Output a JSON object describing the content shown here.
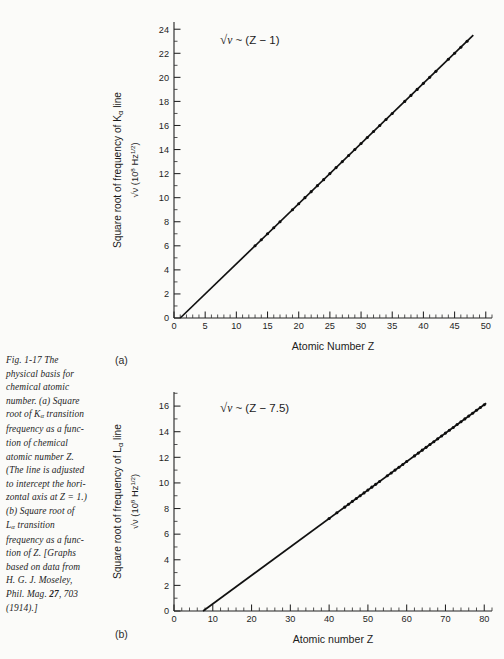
{
  "figure": {
    "caption_lines": [
      "Fig. 1-17   The",
      "physical basis for",
      "chemical atomic",
      "number.   (a) Square",
      "root of Kα transition",
      "frequency as a func-",
      "tion of chemical",
      "atomic number Z.",
      "(The line is adjusted",
      "to intercept the hori-",
      "zontal axis at  Z = 1.)",
      "(b)  Square root of",
      "Lα transition",
      "frequency as a func-",
      "tion of Z.  [Graphs",
      "based on data from",
      "H. G. J. Moseley,",
      "Phil. Mag. 27, 703",
      "(1914).]"
    ],
    "panel_label_a": "(a)",
    "panel_label_b": "(b)"
  },
  "chart_data": [
    {
      "type": "scatter",
      "panel": "(a)",
      "title": "",
      "annotation": "√ν ~ (Z − 1)",
      "xlabel": "Atomic Number Z",
      "ylabel": "Square root of frequency of Kα line  √ν (10⁸ Hz¹ᐟ²)",
      "ylabel_line1": "Square root of frequency of K",
      "ylabel_line1_sub": "α",
      "ylabel_line1_tail": " line",
      "ylabel_line2": "√ν (10⁸ Hz",
      "ylabel_line2_sup": "1/2",
      "ylabel_line2_tail": ")",
      "xlim": [
        0,
        51
      ],
      "ylim": [
        0,
        24.6
      ],
      "xticks": [
        0,
        5,
        10,
        15,
        20,
        25,
        30,
        35,
        40,
        45,
        50
      ],
      "yticks": [
        0,
        2,
        4,
        6,
        8,
        10,
        12,
        14,
        16,
        18,
        20,
        22,
        24
      ],
      "x_minor_step": 1,
      "y_minor_step": 1,
      "grid": false,
      "fit": {
        "intercept_z": 1,
        "slope": 0.5
      },
      "x": [
        13,
        14,
        15,
        16,
        17,
        19,
        20,
        21,
        22,
        23,
        24,
        25,
        26,
        27,
        28,
        29,
        30,
        31,
        32,
        33,
        34,
        35,
        37,
        38,
        39,
        40,
        41,
        42,
        44,
        45,
        46,
        47
      ],
      "y": [
        6.0,
        6.5,
        7.0,
        7.5,
        8.0,
        9.0,
        9.5,
        10.0,
        10.5,
        11.0,
        11.5,
        12.0,
        12.5,
        13.0,
        13.5,
        14.0,
        14.5,
        15.0,
        15.5,
        16.0,
        16.5,
        17.0,
        18.0,
        18.5,
        19.0,
        19.5,
        20.0,
        20.5,
        21.5,
        22.0,
        22.5,
        23.0
      ],
      "line_x": [
        1,
        48
      ],
      "line_y": [
        0,
        23.5
      ]
    },
    {
      "type": "scatter",
      "panel": "(b)",
      "title": "",
      "annotation": "√ν ~ (Z − 7.5)",
      "xlabel": "Atomic number Z",
      "ylabel": "Square root of frequency of Lα line  √ν (10⁸ Hz¹ᐟ²)",
      "ylabel_line1": "Square root of frequency of L",
      "ylabel_line1_sub": "α",
      "ylabel_line1_tail": " line",
      "ylabel_line2": "√ν (10⁸ Hz",
      "ylabel_line2_sup": "1/2",
      "ylabel_line2_tail": ")",
      "xlim": [
        0,
        82
      ],
      "ylim": [
        0,
        17.1
      ],
      "xticks": [
        0,
        10,
        20,
        30,
        40,
        50,
        60,
        70,
        80
      ],
      "yticks": [
        0,
        2,
        4,
        6,
        8,
        10,
        12,
        14,
        16
      ],
      "x_minor_step": 2,
      "y_minor_step": 1,
      "grid": false,
      "fit": {
        "intercept_z": 7.5,
        "slope": 0.2222
      },
      "x": [
        40,
        42,
        44,
        45,
        46,
        47,
        48,
        49,
        50,
        51,
        52,
        53,
        55,
        56,
        57,
        58,
        59,
        60,
        62,
        63,
        64,
        65,
        66,
        67,
        68,
        69,
        70,
        71,
        72,
        73,
        74,
        75,
        76,
        77,
        78,
        79,
        80
      ],
      "y": [
        7.22,
        7.67,
        8.11,
        8.33,
        8.56,
        8.78,
        9.0,
        9.22,
        9.44,
        9.67,
        9.89,
        10.11,
        10.56,
        10.78,
        11.0,
        11.22,
        11.44,
        11.67,
        12.11,
        12.33,
        12.56,
        12.78,
        13.0,
        13.22,
        13.44,
        13.67,
        13.89,
        14.11,
        14.33,
        14.56,
        14.78,
        15.0,
        15.22,
        15.44,
        15.67,
        15.89,
        16.11
      ],
      "line_x": [
        7.5,
        80.5
      ],
      "line_y": [
        0,
        16.22
      ]
    }
  ]
}
